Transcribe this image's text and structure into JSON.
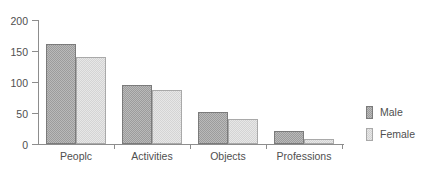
{
  "chart_data": {
    "type": "bar",
    "title": "",
    "subtitle": "",
    "xlabel": "",
    "ylabel": "",
    "categories": [
      "Peoplc",
      "Activities",
      "Objects",
      "Professions"
    ],
    "series": [
      {
        "name": "Male",
        "color": "#9c9c9c",
        "values": [
          162,
          95,
          51,
          21
        ]
      },
      {
        "name": "Female",
        "color": "#d4d4d4",
        "values": [
          140,
          87,
          40,
          8
        ]
      }
    ],
    "ylim": [
      0,
      200
    ],
    "yticks": [
      0,
      50,
      100,
      150,
      200
    ],
    "ytick_labels": [
      "0",
      "50",
      "100",
      "150",
      "200"
    ],
    "grid": false,
    "legend_position": "right",
    "legend_entries": [
      "Male",
      "Female"
    ],
    "annotations": []
  },
  "legend": {
    "items": [
      {
        "label": "Male",
        "swatch": "legend-swatch-male"
      },
      {
        "label": "Female",
        "swatch": "legend-swatch-female"
      }
    ]
  }
}
